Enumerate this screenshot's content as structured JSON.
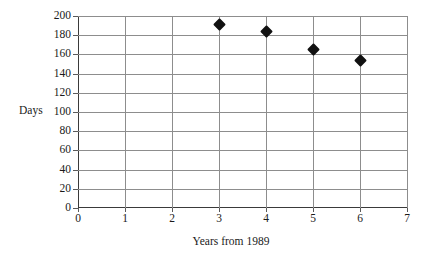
{
  "chart_data": {
    "type": "scatter",
    "title": "",
    "xlabel": "Years from 1989",
    "ylabel": "Days",
    "x": [
      3,
      4,
      5,
      6
    ],
    "values": [
      191,
      184,
      165,
      154
    ],
    "points": [
      {
        "x": 3,
        "y": 191
      },
      {
        "x": 4,
        "y": 184
      },
      {
        "x": 5,
        "y": 165
      },
      {
        "x": 6,
        "y": 154
      }
    ],
    "xlim": [
      0,
      7
    ],
    "ylim": [
      0,
      200
    ],
    "xticks": [
      "0",
      "1",
      "2",
      "3",
      "4",
      "5",
      "6",
      "7"
    ],
    "yticks": [
      "0",
      "20",
      "40",
      "60",
      "80",
      "100",
      "120",
      "140",
      "160",
      "180",
      "200"
    ],
    "xtick_values": [
      0,
      1,
      2,
      3,
      4,
      5,
      6,
      7
    ],
    "ytick_values": [
      0,
      20,
      40,
      60,
      80,
      100,
      120,
      140,
      160,
      180,
      200
    ],
    "grid": true,
    "legend": false,
    "marker_shape": "diamond",
    "marker_color": "#111111",
    "grid_color": "#8d8d8d",
    "axis_color": "#3a3a3a",
    "background": "#ffffff"
  }
}
